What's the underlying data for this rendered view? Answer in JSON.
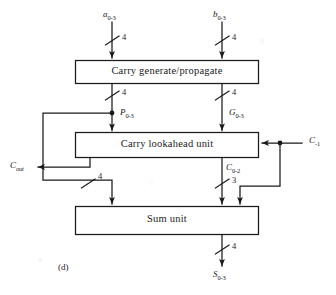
{
  "figure": {
    "sublabel": "(d)",
    "caption_id": "d",
    "type": "block-diagram"
  },
  "blocks": [
    {
      "id": "carry-generate-propagate",
      "label": "Carry generate/propagate"
    },
    {
      "id": "carry-lookahead-unit",
      "label": "Carry lookahead unit"
    },
    {
      "id": "sum-unit",
      "label": "Sum unit"
    }
  ],
  "signals": {
    "a_in": {
      "name": "a",
      "sub": "0-3"
    },
    "b_in": {
      "name": "b",
      "sub": "0-3"
    },
    "p_out": {
      "name": "P",
      "sub": "0-3"
    },
    "g_out": {
      "name": "G",
      "sub": "0-3"
    },
    "c_out": {
      "name": "C",
      "sub": "out"
    },
    "c_in": {
      "name": "C",
      "sub": "-1"
    },
    "c_mid": {
      "name": "C",
      "sub": "0-2"
    },
    "s_out": {
      "name": "S",
      "sub": "0-3"
    }
  },
  "bus_widths": {
    "a_bus": "4",
    "b_bus": "4",
    "p_bus": "4",
    "g_bus": "4",
    "p_to_sum_bus": "4",
    "c_mid_bus": "3",
    "s_bus": "4"
  },
  "colors": {
    "ink": "#1a1a1a",
    "paper": "#ffffff"
  }
}
